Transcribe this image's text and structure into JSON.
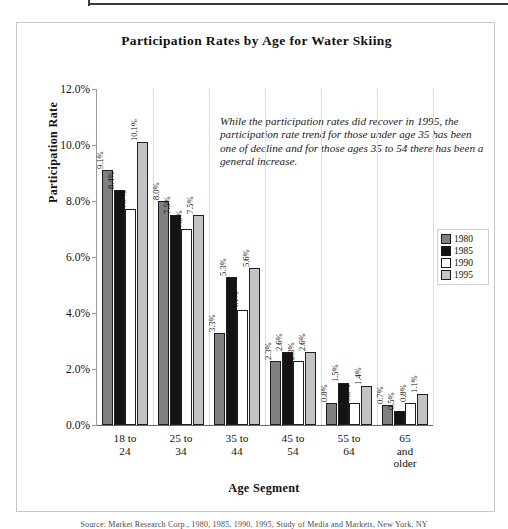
{
  "page": {
    "caption_fragment": "Source: Market Research Corp., 1980, 1985, 1990, 1995, Study of Media and Markets, New York, NY"
  },
  "figure": {
    "title": "Participation Rates by Age for Water Skiing",
    "annotation": "While the participation rates did recover in 1995, the participation rate trend for those under age 35 has been one of decline and for those ages 35 to 54 there has been a general increase."
  },
  "legend": {
    "position": "right-inside",
    "entries": [
      {
        "label": "1980",
        "color": "#808080"
      },
      {
        "label": "1985",
        "color": "#141414"
      },
      {
        "label": "1990",
        "color": "#ffffff"
      },
      {
        "label": "1995",
        "color": "#c4c4c4"
      }
    ]
  },
  "axes": {
    "y_title": "Participation Rate",
    "x_title": "Age Segment",
    "y_ticks": [
      "0.0%",
      "2.0%",
      "4.0%",
      "6.0%",
      "8.0%",
      "10.0%",
      "12.0%"
    ]
  },
  "chart_data": {
    "type": "bar",
    "title": "Participation Rates by Age for Water Skiing",
    "xlabel": "Age Segment",
    "ylabel": "Participation Rate",
    "ylim": [
      0,
      12
    ],
    "ytick_step": 2,
    "ytick_format": "percent",
    "grid": false,
    "legend_position": "right",
    "categories": [
      "18 to 24",
      "25 to 34",
      "35 to 44",
      "45 to 54",
      "55 to 64",
      "65 and older"
    ],
    "category_lines": [
      [
        "18 to",
        "24"
      ],
      [
        "25 to",
        "34"
      ],
      [
        "35 to",
        "44"
      ],
      [
        "45 to",
        "54"
      ],
      [
        "55 to",
        "64"
      ],
      [
        "65",
        "and",
        "older"
      ]
    ],
    "series": [
      {
        "name": "1980",
        "color": "#808080",
        "values": [
          9.1,
          8.0,
          3.3,
          2.3,
          0.8,
          0.7
        ],
        "labels": [
          "9.1%",
          "8.0%",
          "3.3%",
          "2.3%",
          "0.8%",
          "0.7%"
        ]
      },
      {
        "name": "1985",
        "color": "#141414",
        "values": [
          8.4,
          7.5,
          5.3,
          2.6,
          1.5,
          0.5
        ],
        "labels": [
          "8.4%",
          "7.5%",
          "5.3%",
          "2.6%",
          "1.5%",
          "0.5%"
        ]
      },
      {
        "name": "1990",
        "color": "#ffffff",
        "values": [
          7.7,
          7.0,
          4.1,
          2.3,
          0.8,
          0.8
        ],
        "labels": [
          "7.7%",
          "7.0%",
          "4.1%",
          "2.3%",
          "0.8%",
          "0.8%"
        ]
      },
      {
        "name": "1995",
        "color": "#c4c4c4",
        "values": [
          10.1,
          7.5,
          5.6,
          2.6,
          1.4,
          1.1
        ],
        "labels": [
          "10.1%",
          "7.5%",
          "5.6%",
          "2.6%",
          "1.4%",
          "1.1%"
        ]
      }
    ],
    "annotation": "While the participation rates did recover in 1995, the participation rate trend for those under age 35 has been one of decline and for those ages 35 to 54 there has been a general increase."
  }
}
